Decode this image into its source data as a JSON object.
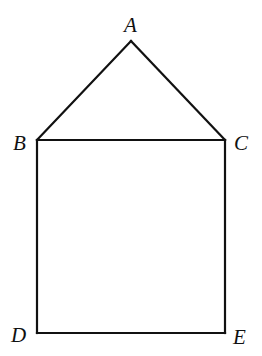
{
  "diagram": {
    "points": {
      "A": {
        "label": "A",
        "x": 131,
        "y": 41
      },
      "B": {
        "label": "B",
        "x": 37,
        "y": 140
      },
      "C": {
        "label": "C",
        "x": 225,
        "y": 140
      },
      "D": {
        "label": "D",
        "x": 37,
        "y": 333
      },
      "E": {
        "label": "E",
        "x": 225,
        "y": 333
      }
    },
    "segments": [
      "AB",
      "AC",
      "BC",
      "BD",
      "CE",
      "DE"
    ],
    "line_color": "#111111"
  }
}
